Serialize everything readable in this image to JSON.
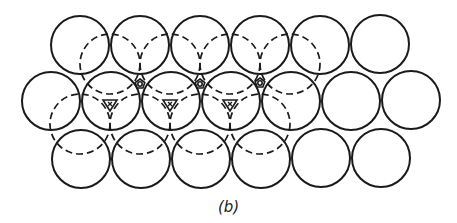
{
  "figure": {
    "caption": "(b)",
    "colors": {
      "stroke": "#1a1a1a",
      "background": "#ffffff"
    },
    "radius": 29,
    "solid_circles": [
      {
        "row": "top",
        "cx": 80,
        "cy": 45
      },
      {
        "row": "top",
        "cx": 140,
        "cy": 45
      },
      {
        "row": "top",
        "cx": 200,
        "cy": 45
      },
      {
        "row": "top",
        "cx": 260,
        "cy": 45
      },
      {
        "row": "top",
        "cx": 320,
        "cy": 45
      },
      {
        "row": "top",
        "cx": 380,
        "cy": 44
      },
      {
        "row": "middle",
        "cx": 51,
        "cy": 101
      },
      {
        "row": "middle",
        "cx": 111,
        "cy": 101
      },
      {
        "row": "middle",
        "cx": 171,
        "cy": 101
      },
      {
        "row": "middle",
        "cx": 231,
        "cy": 101
      },
      {
        "row": "middle",
        "cx": 291,
        "cy": 101
      },
      {
        "row": "middle",
        "cx": 351,
        "cy": 101
      },
      {
        "row": "middle",
        "cx": 411,
        "cy": 100
      },
      {
        "row": "bottom",
        "cx": 81,
        "cy": 159
      },
      {
        "row": "bottom",
        "cx": 141,
        "cy": 159
      },
      {
        "row": "bottom",
        "cx": 201,
        "cy": 159
      },
      {
        "row": "bottom",
        "cx": 261,
        "cy": 159
      },
      {
        "row": "bottom",
        "cx": 321,
        "cy": 158
      },
      {
        "row": "bottom",
        "cx": 381,
        "cy": 158
      }
    ],
    "dashed_circles": [
      {
        "row": "upper",
        "cx": 110,
        "cy": 64
      },
      {
        "row": "upper",
        "cx": 170,
        "cy": 64
      },
      {
        "row": "upper",
        "cx": 230,
        "cy": 64
      },
      {
        "row": "upper",
        "cx": 290,
        "cy": 64
      },
      {
        "row": "lower",
        "cx": 80,
        "cy": 124
      },
      {
        "row": "lower",
        "cx": 140,
        "cy": 124
      },
      {
        "row": "lower",
        "cx": 200,
        "cy": 124
      },
      {
        "row": "lower",
        "cx": 260,
        "cy": 124
      }
    ],
    "octahedral_markers": [
      {
        "cx": 140,
        "cy": 84
      },
      {
        "cx": 200,
        "cy": 84
      },
      {
        "cx": 260,
        "cy": 83
      }
    ],
    "tetrahedral_markers": [
      {
        "cx": 110,
        "cy": 104,
        "label": "x"
      },
      {
        "cx": 170,
        "cy": 104,
        "label": "x"
      },
      {
        "cx": 230,
        "cy": 104,
        "label": "x"
      }
    ]
  }
}
